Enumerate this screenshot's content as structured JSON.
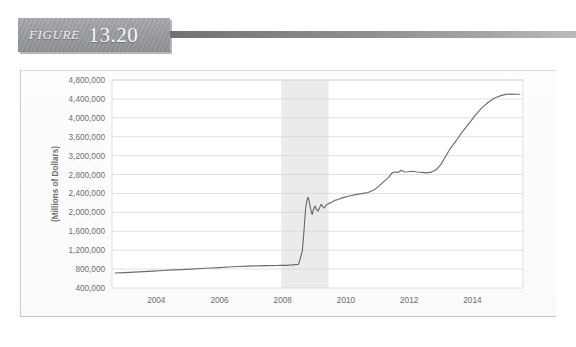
{
  "figure": {
    "label": "FIGURE",
    "number": "13.20"
  },
  "chart_data": {
    "type": "line",
    "title": "",
    "subtitle": "",
    "xlabel": "",
    "ylabel": "(Millions of Dollars)",
    "grid": true,
    "legend": null,
    "xlim": [
      2002.6,
      2015.6
    ],
    "ylim": [
      400000,
      4800000
    ],
    "x_tick_labels": [
      "2004",
      "2006",
      "2008",
      "2010",
      "2012",
      "2014"
    ],
    "x_ticks": [
      2004,
      2006,
      2008,
      2010,
      2012,
      2014
    ],
    "y_tick_labels": [
      "4,800,000",
      "4,400,000",
      "4,000,000",
      "3,600,000",
      "3,200,000",
      "2,800,000",
      "2,400,000",
      "2,000,000",
      "1,600,000",
      "1,200,000",
      "800,000",
      "400,000"
    ],
    "y_ticks": [
      4800000,
      4400000,
      4000000,
      3600000,
      3200000,
      2800000,
      2400000,
      2000000,
      1600000,
      1200000,
      800000,
      400000
    ],
    "shaded_regions": [
      {
        "name": "recession",
        "x_start": 2007.95,
        "x_end": 2009.45,
        "color": "#ebebec"
      }
    ],
    "line_color": "#6b6c6e",
    "series": [
      {
        "name": "Total Assets",
        "x": [
          2002.7,
          2003.0,
          2003.3,
          2003.6,
          2003.9,
          2004.2,
          2004.5,
          2004.8,
          2005.1,
          2005.4,
          2005.7,
          2006.0,
          2006.3,
          2006.6,
          2006.9,
          2007.2,
          2007.5,
          2007.8,
          2007.95,
          2008.1,
          2008.3,
          2008.5,
          2008.62,
          2008.68,
          2008.72,
          2008.76,
          2008.8,
          2008.84,
          2008.88,
          2008.93,
          2008.97,
          2009.02,
          2009.07,
          2009.12,
          2009.17,
          2009.22,
          2009.27,
          2009.32,
          2009.37,
          2009.45,
          2009.55,
          2009.65,
          2009.75,
          2009.85,
          2009.95,
          2010.1,
          2010.3,
          2010.5,
          2010.7,
          2010.9,
          2011.05,
          2011.2,
          2011.35,
          2011.45,
          2011.55,
          2011.65,
          2011.75,
          2011.85,
          2011.95,
          2012.1,
          2012.25,
          2012.4,
          2012.55,
          2012.7,
          2012.85,
          2013.0,
          2013.15,
          2013.3,
          2013.5,
          2013.7,
          2013.9,
          2014.1,
          2014.3,
          2014.5,
          2014.7,
          2014.9,
          2015.05,
          2015.2,
          2015.35,
          2015.5
        ],
        "y": [
          718000,
          726000,
          735000,
          745000,
          757000,
          770000,
          782000,
          790000,
          800000,
          812000,
          822000,
          832000,
          845000,
          855000,
          862000,
          868000,
          872000,
          876000,
          878000,
          880000,
          888000,
          900000,
          1180000,
          1680000,
          2050000,
          2240000,
          2320000,
          2230000,
          2080000,
          1955000,
          2050000,
          2135000,
          2060000,
          2030000,
          2105000,
          2170000,
          2120000,
          2095000,
          2150000,
          2185000,
          2215000,
          2255000,
          2270000,
          2300000,
          2318000,
          2345000,
          2375000,
          2395000,
          2420000,
          2480000,
          2560000,
          2650000,
          2740000,
          2830000,
          2855000,
          2845000,
          2890000,
          2855000,
          2860000,
          2870000,
          2855000,
          2845000,
          2835000,
          2850000,
          2900000,
          3010000,
          3180000,
          3350000,
          3530000,
          3720000,
          3890000,
          4060000,
          4210000,
          4330000,
          4420000,
          4470000,
          4495000,
          4505000,
          4500000,
          4498000
        ]
      }
    ]
  }
}
